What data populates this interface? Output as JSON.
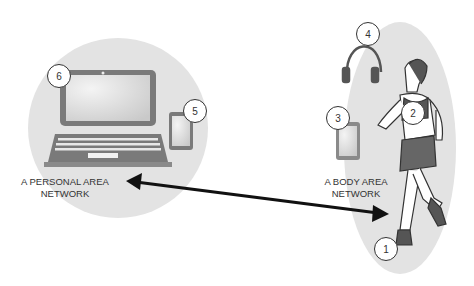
{
  "labels": {
    "pan_line1": "A PERSONAL AREA",
    "pan_line2": "NETWORK",
    "ban_line1": "A BODY AREA",
    "ban_line2": "NETWORK"
  },
  "markers": [
    "1",
    "2",
    "3",
    "4",
    "5",
    "6"
  ],
  "colors": {
    "zone": "#e2e2e2",
    "device": "#777777",
    "screen": "#d4d4d4",
    "arrow": "#111111"
  }
}
